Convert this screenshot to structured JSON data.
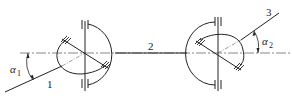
{
  "diagram": {
    "type": "double universal joint (Cardan) kinematic sketch",
    "colors": {
      "line": "#222222",
      "centerline": "#555555",
      "background": "#ffffff"
    },
    "shafts": [
      {
        "id": "1",
        "label": "1",
        "role": "input shaft"
      },
      {
        "id": "2",
        "label": "2",
        "role": "intermediate shaft"
      },
      {
        "id": "3",
        "label": "3",
        "role": "output shaft"
      }
    ],
    "angles": [
      {
        "id": "alpha1",
        "symbol": "α",
        "subscript": "1"
      },
      {
        "id": "alpha2",
        "symbol": "α",
        "subscript": "2"
      }
    ],
    "joints": [
      {
        "id": "left-joint",
        "position": "left"
      },
      {
        "id": "right-joint",
        "position": "right"
      }
    ]
  }
}
